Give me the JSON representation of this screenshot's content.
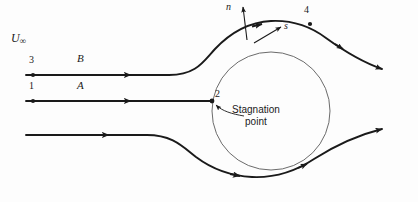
{
  "figure": {
    "type": "fluid-flow-diagram",
    "labels": {
      "freestream_symbol": "U",
      "freestream_subscript": "∞",
      "point_3": "3",
      "streamline_B": "B",
      "point_1": "1",
      "streamline_A": "A",
      "point_2": "2",
      "point_4": "4",
      "normal_vector": "n",
      "tangent_vector": "s",
      "stagnation_line1": "Stagnation",
      "stagnation_line2": "point"
    },
    "geometry": {
      "cylinder": {
        "cx": 271,
        "cy": 111,
        "r": 59
      },
      "streamline_B_y": 75,
      "streamline_A_y": 101,
      "streamline_bottom_y": 135,
      "stagnation_point": {
        "x": 212,
        "y": 101
      },
      "point_3": {
        "x": 33,
        "y": 75
      },
      "point_1": {
        "x": 33,
        "y": 101
      },
      "point_4": {
        "x": 310,
        "y": 24
      }
    },
    "colors": {
      "streamline": "#1a1a1a",
      "cylinder_outline": "#555555",
      "background": "#fdfdfd",
      "text": "#1a1a1a"
    }
  }
}
